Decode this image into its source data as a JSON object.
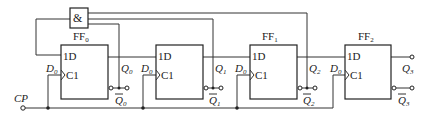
{
  "diagram": {
    "type": "synchronous counter circuit",
    "gate": {
      "label": "&"
    },
    "clock": {
      "label": "CP"
    },
    "flipflops": [
      {
        "title": "FF",
        "title_sub": "0",
        "d_label": "1D",
        "c_label": "C1",
        "in_label": "D",
        "in_sub": "0",
        "q_label": "Q",
        "q_sub": "0",
        "qbar_label": "Q",
        "qbar_sub": "0"
      },
      {
        "title": "",
        "title_sub": "",
        "d_label": "1D",
        "c_label": "C1",
        "in_label": "D",
        "in_sub": "0",
        "q_label": "Q",
        "q_sub": "1",
        "qbar_label": "Q",
        "qbar_sub": "1"
      },
      {
        "title": "FF",
        "title_sub": "1",
        "d_label": "1D",
        "c_label": "C1",
        "in_label": "D",
        "in_sub": "0",
        "q_label": "Q",
        "q_sub": "2",
        "qbar_label": "Q",
        "qbar_sub": "2"
      },
      {
        "title": "FF",
        "title_sub": "2",
        "d_label": "1D",
        "c_label": "C1",
        "in_label": "D",
        "in_sub": "0",
        "q_label": "Q",
        "q_sub": "3",
        "qbar_label": "Q",
        "qbar_sub": "3"
      }
    ]
  }
}
